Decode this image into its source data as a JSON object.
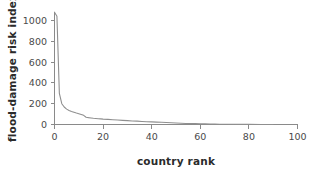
{
  "chart_data": {
    "type": "line",
    "title": "",
    "xlabel": "country rank",
    "ylabel": "flood-damage risk index",
    "xlim": [
      0,
      100
    ],
    "ylim": [
      0,
      1080
    ],
    "grid": false,
    "legend": false,
    "legend_position": "none",
    "line_color": "#8f8f8f",
    "axis_color": "#8a8a8a",
    "background_color": "#ffffff",
    "xticks": [
      0,
      20,
      40,
      60,
      80,
      100
    ],
    "yticks": [
      0,
      200,
      400,
      600,
      800,
      1000
    ],
    "x": [
      0,
      1,
      2,
      3,
      4,
      5,
      6,
      7,
      8,
      9,
      10,
      11,
      12,
      13,
      14,
      15,
      16,
      17,
      18,
      19,
      20,
      22,
      24,
      26,
      28,
      30,
      32,
      34,
      36,
      38,
      40,
      42,
      44,
      46,
      48,
      50,
      52,
      54,
      56,
      58,
      60,
      62,
      64,
      66,
      68,
      70,
      75,
      80,
      85,
      90
    ],
    "y": [
      1080,
      1040,
      300,
      200,
      168,
      148,
      135,
      125,
      118,
      110,
      104,
      96,
      88,
      70,
      66,
      63,
      60,
      58,
      56,
      54,
      52,
      49,
      46,
      43,
      40,
      37,
      34,
      32,
      29,
      27,
      25,
      23,
      21,
      19,
      17,
      14,
      12,
      10,
      9,
      8,
      7,
      6,
      5,
      4,
      3,
      2,
      1,
      1,
      0,
      0
    ]
  },
  "axis": {
    "y_title": "flood-damage risk index",
    "x_title": "country rank",
    "ytick_labels": [
      "0",
      "200",
      "400",
      "600",
      "800",
      "1000"
    ],
    "xtick_labels": [
      "0",
      "20",
      "40",
      "60",
      "80",
      "100"
    ]
  }
}
